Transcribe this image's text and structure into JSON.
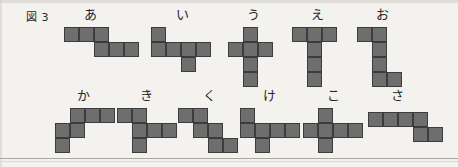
{
  "figure": {
    "caption": "図 3",
    "cell_size_px": 15,
    "cell_fill_color": "#6e6e6e",
    "cell_border_color": "#3c3c3c",
    "background_color": "#f4f2ee"
  },
  "rows": [
    {
      "row_name": "top-row",
      "shapes": [
        {
          "label": "あ",
          "label_x": 84,
          "label_y": 8,
          "origin_x": 64,
          "origin_y": 27,
          "cells": [
            [
              0,
              0
            ],
            [
              1,
              0
            ],
            [
              2,
              0
            ],
            [
              2,
              1
            ],
            [
              3,
              1
            ],
            [
              4,
              1
            ]
          ],
          "cell_count": 6,
          "shape_kind": "S-hexomino"
        },
        {
          "label": "い",
          "label_x": 176,
          "label_y": 8,
          "origin_x": 151,
          "origin_y": 27,
          "cells": [
            [
              0,
              0
            ],
            [
              0,
              1
            ],
            [
              1,
              1
            ],
            [
              2,
              1
            ],
            [
              3,
              1
            ],
            [
              2,
              2
            ]
          ],
          "cell_count": 6,
          "shape_kind": "branched-hexomino"
        },
        {
          "label": "う",
          "label_x": 247,
          "label_y": 8,
          "origin_x": 228,
          "origin_y": 27,
          "cells": [
            [
              1,
              0
            ],
            [
              0,
              1
            ],
            [
              1,
              1
            ],
            [
              2,
              1
            ],
            [
              1,
              2
            ],
            [
              1,
              3
            ]
          ],
          "cell_count": 6,
          "shape_kind": "cross-hexomino"
        },
        {
          "label": "え",
          "label_x": 311,
          "label_y": 8,
          "origin_x": 292,
          "origin_y": 27,
          "cells": [
            [
              0,
              0
            ],
            [
              1,
              0
            ],
            [
              2,
              0
            ],
            [
              1,
              1
            ],
            [
              1,
              2
            ],
            [
              1,
              3
            ]
          ],
          "cell_count": 6,
          "shape_kind": "T-hexomino"
        },
        {
          "label": "お",
          "label_x": 376,
          "label_y": 8,
          "origin_x": 357,
          "origin_y": 27,
          "cells": [
            [
              0,
              0
            ],
            [
              1,
              0
            ],
            [
              1,
              1
            ],
            [
              1,
              2
            ],
            [
              1,
              3
            ],
            [
              2,
              3
            ]
          ],
          "cell_count": 6,
          "shape_kind": "Z-hexomino"
        }
      ]
    },
    {
      "row_name": "bottom-row",
      "shapes": [
        {
          "label": "か",
          "label_x": 77,
          "label_y": 89,
          "origin_x": 55,
          "origin_y": 108,
          "cells": [
            [
              1,
              0
            ],
            [
              2,
              0
            ],
            [
              3,
              0
            ],
            [
              0,
              1
            ],
            [
              1,
              1
            ],
            [
              0,
              2
            ]
          ],
          "cell_count": 6,
          "shape_kind": "staircase-hexomino"
        },
        {
          "label": "き",
          "label_x": 140,
          "label_y": 89,
          "origin_x": 117,
          "origin_y": 108,
          "cells": [
            [
              0,
              0
            ],
            [
              1,
              0
            ],
            [
              1,
              1
            ],
            [
              2,
              1
            ],
            [
              3,
              1
            ],
            [
              1,
              2
            ]
          ],
          "cell_count": 6,
          "shape_kind": "branched-hexomino"
        },
        {
          "label": "く",
          "label_x": 203,
          "label_y": 89,
          "origin_x": 178,
          "origin_y": 108,
          "cells": [
            [
              0,
              0
            ],
            [
              1,
              0
            ],
            [
              1,
              1
            ],
            [
              2,
              1
            ],
            [
              2,
              2
            ],
            [
              3,
              2
            ]
          ],
          "cell_count": 6,
          "shape_kind": "W-staircase-hexomino"
        },
        {
          "label": "け",
          "label_x": 263,
          "label_y": 89,
          "origin_x": 240,
          "origin_y": 108,
          "cells": [
            [
              0,
              0
            ],
            [
              0,
              1
            ],
            [
              1,
              1
            ],
            [
              2,
              1
            ],
            [
              3,
              1
            ],
            [
              1,
              2
            ]
          ],
          "cell_count": 6,
          "shape_kind": "branched-hexomino"
        },
        {
          "label": "こ",
          "label_x": 327,
          "label_y": 89,
          "origin_x": 303,
          "origin_y": 108,
          "cells": [
            [
              1,
              0
            ],
            [
              0,
              1
            ],
            [
              1,
              1
            ],
            [
              2,
              1
            ],
            [
              3,
              1
            ],
            [
              1,
              2
            ]
          ],
          "cell_count": 6,
          "shape_kind": "cross-hexomino"
        },
        {
          "label": "さ",
          "label_x": 391,
          "label_y": 89,
          "origin_x": 368,
          "origin_y": 112,
          "cells": [
            [
              0,
              0
            ],
            [
              1,
              0
            ],
            [
              2,
              0
            ],
            [
              3,
              0
            ],
            [
              3,
              1
            ],
            [
              4,
              1
            ]
          ],
          "cell_count": 6,
          "shape_kind": "S-hexomino"
        }
      ]
    }
  ]
}
